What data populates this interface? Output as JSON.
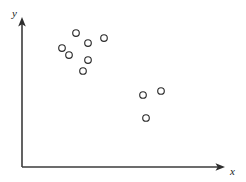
{
  "chart_data": {
    "type": "scatter",
    "title": "",
    "subtitle": "",
    "xlabel": "x",
    "ylabel": "y",
    "grid": false,
    "legend": null,
    "axis_style": "arrow-tipped L-shaped axes, no tick marks, no tick labels",
    "xlim": [
      0,
      10
    ],
    "ylim": [
      0,
      10
    ],
    "marker": {
      "shape": "open-circle",
      "radius_px": 3.3,
      "fill": "none",
      "stroke": "#2b2b2b",
      "stroke_width_px": 1.15
    },
    "point_count": 10,
    "clusters": [
      {
        "name": "upper-left-cluster",
        "count": 7,
        "points_px": [
          {
            "x": 76,
            "y": 33
          },
          {
            "x": 88,
            "y": 43
          },
          {
            "x": 104,
            "y": 38
          },
          {
            "x": 62,
            "y": 48
          },
          {
            "x": 69,
            "y": 55
          },
          {
            "x": 88,
            "y": 60
          },
          {
            "x": 83,
            "y": 71
          }
        ],
        "points_data": [
          {
            "x": 2.7,
            "y": 8.4
          },
          {
            "x": 3.4,
            "y": 7.7
          },
          {
            "x": 4.3,
            "y": 8.1
          },
          {
            "x": 2.1,
            "y": 7.3
          },
          {
            "x": 2.5,
            "y": 6.8
          },
          {
            "x": 3.4,
            "y": 6.4
          },
          {
            "x": 3.2,
            "y": 5.7
          }
        ]
      },
      {
        "name": "lower-right-cluster",
        "count": 3,
        "points_px": [
          {
            "x": 143,
            "y": 95
          },
          {
            "x": 161,
            "y": 91
          },
          {
            "x": 146,
            "y": 118
          }
        ],
        "points_data": [
          {
            "x": 6.5,
            "y": 4.1
          },
          {
            "x": 7.5,
            "y": 4.4
          },
          {
            "x": 6.7,
            "y": 2.6
          }
        ]
      }
    ],
    "all_points_px": [
      {
        "x": 76,
        "y": 33
      },
      {
        "x": 88,
        "y": 43
      },
      {
        "x": 104,
        "y": 38
      },
      {
        "x": 62,
        "y": 48
      },
      {
        "x": 69,
        "y": 55
      },
      {
        "x": 88,
        "y": 60
      },
      {
        "x": 83,
        "y": 71
      },
      {
        "x": 143,
        "y": 95
      },
      {
        "x": 161,
        "y": 91
      },
      {
        "x": 146,
        "y": 118
      }
    ]
  },
  "axes": {
    "origin_px": {
      "x": 22,
      "y": 167
    },
    "x_axis": {
      "label": "x",
      "start_px": {
        "x": 22,
        "y": 167
      },
      "end_px": {
        "x": 224,
        "y": 167
      },
      "label_px": {
        "x": 233,
        "y": 171
      }
    },
    "y_axis": {
      "label": "y",
      "start_px": {
        "x": 22,
        "y": 167
      },
      "end_px": {
        "x": 22,
        "y": 19
      },
      "label_px": {
        "x": 15,
        "y": 13
      }
    }
  },
  "colors": {
    "background": "#ffffff",
    "axis": "#3b3b3b",
    "arrow": "#2e2e2e",
    "label": "#1a1a1a",
    "marker_stroke": "#2b2b2b"
  }
}
